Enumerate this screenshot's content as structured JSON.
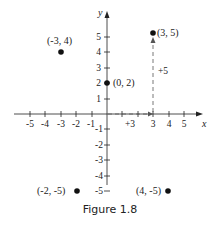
{
  "figure": {
    "caption": "Figure 1.8",
    "axis_x_label": "x",
    "axis_y_label": "y",
    "x_ticks": [
      "-5",
      "-4",
      "-3",
      "-2",
      "-1",
      "3",
      "4",
      "5"
    ],
    "y_ticks": [
      "5",
      "4",
      "3",
      "2",
      "1",
      "-1",
      "-2",
      "-3",
      "-4",
      "-5"
    ],
    "points": [
      {
        "label": "(-3, 4)",
        "x": -3,
        "y": 4
      },
      {
        "label": "(0, 2)",
        "x": 0,
        "y": 2
      },
      {
        "label": "(3, 5)",
        "x": 3,
        "y": 5
      },
      {
        "label": "(-2, -5)",
        "x": -2,
        "y": -5
      },
      {
        "label": "(4, -5)",
        "x": 4,
        "y": -5
      }
    ],
    "annotations": {
      "horizontal_step": "+3",
      "vertical_step": "+5"
    },
    "colors": {
      "ink": "#111111",
      "dashed": "#555555"
    }
  }
}
